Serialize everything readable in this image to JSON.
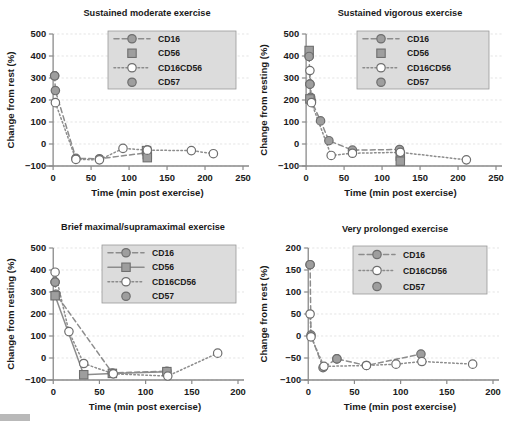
{
  "figure": {
    "panel_count": 4,
    "colors": {
      "marker_gray": "#9e9e9e",
      "marker_dark_gray": "#8c8c8c",
      "marker_white": "#ffffff",
      "line_gray": "#8c8c8c",
      "outline": "#6e6e6e",
      "grid": "#d9d9d9",
      "axis": "#8a8a8a",
      "legend_bg": "#dcdcdc",
      "text": "#1a1a1a"
    }
  },
  "charts": [
    {
      "id": "sustained-moderate",
      "type": "line",
      "title": "Sustained moderate exercise",
      "xlabel": "Time (min post exercise)",
      "ylabel": "Change from rest (%)",
      "xlim": [
        -12,
        250
      ],
      "ylim": [
        -100,
        500
      ],
      "xticks": [
        0,
        50,
        100,
        150,
        200,
        250
      ],
      "yticks": [
        -100,
        0,
        100,
        200,
        300,
        400,
        500
      ],
      "grid": true,
      "legend_position": "upper-right",
      "series": [
        {
          "name": "CD16",
          "marker": "circle",
          "fill": "#9e9e9e",
          "line": "dashed",
          "points": [
            {
              "x": 2,
              "y": 310
            },
            {
              "x": 3,
              "y": 243
            },
            {
              "x": 30,
              "y": -65
            },
            {
              "x": 61,
              "y": -67
            },
            {
              "x": 123,
              "y": -40
            },
            {
              "x": 124,
              "y": -27
            }
          ]
        },
        {
          "name": "CD56",
          "marker": "square",
          "fill": "#9e9e9e",
          "line": "none",
          "points": [
            {
              "x": 123,
              "y": -30
            },
            {
              "x": 124,
              "y": -48
            },
            {
              "x": 124,
              "y": -62
            }
          ]
        },
        {
          "name": "CD16CD56",
          "marker": "circle",
          "fill": "#ffffff",
          "line": "dotted",
          "points": [
            {
              "x": 3,
              "y": 188
            },
            {
              "x": 30,
              "y": -70
            },
            {
              "x": 61,
              "y": -72
            },
            {
              "x": 92,
              "y": -20
            },
            {
              "x": 124,
              "y": -28
            },
            {
              "x": 182,
              "y": -30
            },
            {
              "x": 211,
              "y": -44
            }
          ]
        },
        {
          "name": "CD57",
          "marker": "circle",
          "fill": "#9e9e9e",
          "line": "none",
          "points": [
            {
              "x": 2,
              "y": 310
            }
          ]
        }
      ]
    },
    {
      "id": "sustained-vigorous",
      "type": "line",
      "title": "Sustained vigorous exercise",
      "xlabel": "Time (min post exercise)",
      "ylabel": "Change from resting (%)",
      "xlim": [
        -12,
        250
      ],
      "ylim": [
        -100,
        500
      ],
      "xticks": [
        0,
        50,
        100,
        150,
        200,
        250
      ],
      "yticks": [
        -100,
        0,
        100,
        200,
        300,
        400,
        500
      ],
      "grid": true,
      "legend_position": "upper-right",
      "series": [
        {
          "name": "CD16",
          "marker": "circle",
          "fill": "#9e9e9e",
          "line": "dashed",
          "points": [
            {
              "x": 4,
              "y": 398
            },
            {
              "x": 5,
              "y": 272
            },
            {
              "x": 6,
              "y": 212
            },
            {
              "x": 7,
              "y": 196
            },
            {
              "x": 19,
              "y": 105
            },
            {
              "x": 30,
              "y": 15
            },
            {
              "x": 61,
              "y": -28
            },
            {
              "x": 123,
              "y": -25
            },
            {
              "x": 124,
              "y": -40
            }
          ]
        },
        {
          "name": "CD56",
          "marker": "square",
          "fill": "#9e9e9e",
          "line": "none",
          "points": [
            {
              "x": 4,
              "y": 425
            },
            {
              "x": 5,
              "y": 205
            },
            {
              "x": 124,
              "y": -55
            },
            {
              "x": 124,
              "y": -78
            }
          ]
        },
        {
          "name": "CD16CD56",
          "marker": "circle",
          "fill": "#ffffff",
          "line": "dotted",
          "points": [
            {
              "x": 5,
              "y": 334
            },
            {
              "x": 7,
              "y": 188
            },
            {
              "x": 33,
              "y": -52
            },
            {
              "x": 61,
              "y": -42
            },
            {
              "x": 124,
              "y": -38
            },
            {
              "x": 211,
              "y": -72
            }
          ]
        },
        {
          "name": "CD57",
          "marker": "circle",
          "fill": "#9e9e9e",
          "line": "none",
          "points": [
            {
              "x": 4,
              "y": 398
            },
            {
              "x": 5,
              "y": 272
            }
          ]
        }
      ]
    },
    {
      "id": "brief-maximal",
      "type": "line",
      "title": "Brief maximal/supramaximal exercise",
      "xlabel": "Time (min post exercise)",
      "ylabel": "Change from resting (%)",
      "xlim": [
        -10,
        200
      ],
      "ylim": [
        -100,
        500
      ],
      "xticks": [
        0,
        50,
        100,
        150,
        200
      ],
      "yticks": [
        -100,
        0,
        100,
        200,
        300,
        400,
        500
      ],
      "grid": true,
      "legend_position": "upper-right",
      "series": [
        {
          "name": "CD16",
          "marker": "circle",
          "fill": "#9e9e9e",
          "line": "dashed",
          "points": [
            {
              "x": 2,
              "y": 345
            },
            {
              "x": 3,
              "y": 290
            },
            {
              "x": 64,
              "y": -68
            },
            {
              "x": 123,
              "y": -60
            }
          ]
        },
        {
          "name": "CD56",
          "marker": "square",
          "fill": "#9e9e9e",
          "line": "solid",
          "points": [
            {
              "x": 2,
              "y": 283
            },
            {
              "x": 33,
              "y": -76
            },
            {
              "x": 64,
              "y": -70
            },
            {
              "x": 123,
              "y": -62
            }
          ]
        },
        {
          "name": "CD16CD56",
          "marker": "circle",
          "fill": "#ffffff",
          "line": "dotted",
          "points": [
            {
              "x": 2,
              "y": 390
            },
            {
              "x": 17,
              "y": 120
            },
            {
              "x": 33,
              "y": -25
            },
            {
              "x": 65,
              "y": -72
            },
            {
              "x": 124,
              "y": -82
            },
            {
              "x": 178,
              "y": 22
            }
          ]
        },
        {
          "name": "CD57",
          "marker": "circle",
          "fill": "#9e9e9e",
          "line": "none",
          "points": [
            {
              "x": 2,
              "y": 345
            }
          ]
        }
      ]
    },
    {
      "id": "very-prolonged",
      "type": "line",
      "title": "Very prolonged exercise",
      "xlabel": "Time (min post exercise)",
      "ylabel": "Change from rest (%)",
      "xlim": [
        -10,
        200
      ],
      "ylim": [
        -100,
        200
      ],
      "xticks": [
        0,
        50,
        100,
        150,
        200
      ],
      "yticks": [
        -100,
        -50,
        0,
        50,
        100,
        150,
        200
      ],
      "grid": true,
      "legend_position": "upper-right",
      "series": [
        {
          "name": "CD16",
          "marker": "circle",
          "fill": "#9e9e9e",
          "line": "dashed",
          "points": [
            {
              "x": 2,
              "y": 162
            },
            {
              "x": 3,
              "y": 2
            },
            {
              "x": 16,
              "y": -72
            },
            {
              "x": 31,
              "y": -52
            },
            {
              "x": 63,
              "y": -67
            },
            {
              "x": 122,
              "y": -41
            }
          ]
        },
        {
          "name": "CD16CD56",
          "marker": "circle",
          "fill": "#ffffff",
          "line": "dotted",
          "points": [
            {
              "x": 2,
              "y": 50
            },
            {
              "x": 3,
              "y": -2
            },
            {
              "x": 17,
              "y": -69
            },
            {
              "x": 63,
              "y": -67
            },
            {
              "x": 95,
              "y": -64
            },
            {
              "x": 123,
              "y": -58
            },
            {
              "x": 178,
              "y": -64
            }
          ]
        },
        {
          "name": "CD57",
          "marker": "circle",
          "fill": "#9e9e9e",
          "line": "none",
          "points": [
            {
              "x": 2,
              "y": 162
            },
            {
              "x": 31,
              "y": -52
            }
          ]
        }
      ]
    }
  ],
  "chart_data": {
    "type": "line",
    "xlabel": "Time (min post exercise)",
    "panels": [
      {
        "title": "Sustained moderate exercise",
        "ylabel": "Change from rest (%)",
        "xlim": [
          0,
          250
        ],
        "ylim": [
          -100,
          500
        ],
        "series": [
          {
            "name": "CD16",
            "x": [
              2,
              3,
              30,
              61,
              123,
              124
            ],
            "y": [
              310,
              243,
              -65,
              -67,
              -40,
              -27
            ]
          },
          {
            "name": "CD56",
            "x": [
              123,
              124,
              124
            ],
            "y": [
              -30,
              -48,
              -62
            ]
          },
          {
            "name": "CD16CD56",
            "x": [
              3,
              30,
              61,
              92,
              124,
              182,
              211
            ],
            "y": [
              188,
              -70,
              -72,
              -20,
              -28,
              -30,
              -44
            ]
          },
          {
            "name": "CD57",
            "x": [
              2
            ],
            "y": [
              310
            ]
          }
        ]
      },
      {
        "title": "Sustained vigorous exercise",
        "ylabel": "Change from resting (%)",
        "xlim": [
          0,
          250
        ],
        "ylim": [
          -100,
          500
        ],
        "series": [
          {
            "name": "CD16",
            "x": [
              4,
              5,
              6,
              7,
              19,
              30,
              61,
              123,
              124
            ],
            "y": [
              398,
              272,
              212,
              196,
              105,
              15,
              -28,
              -25,
              -40
            ]
          },
          {
            "name": "CD56",
            "x": [
              4,
              5,
              124,
              124
            ],
            "y": [
              425,
              205,
              -55,
              -78
            ]
          },
          {
            "name": "CD16CD56",
            "x": [
              5,
              7,
              33,
              61,
              124,
              211
            ],
            "y": [
              334,
              188,
              -52,
              -42,
              -38,
              -72
            ]
          },
          {
            "name": "CD57",
            "x": [
              4,
              5
            ],
            "y": [
              398,
              272
            ]
          }
        ]
      },
      {
        "title": "Brief maximal/supramaximal exercise",
        "ylabel": "Change from resting (%)",
        "xlim": [
          0,
          200
        ],
        "ylim": [
          -100,
          500
        ],
        "series": [
          {
            "name": "CD16",
            "x": [
              2,
              3,
              64,
              123
            ],
            "y": [
              345,
              290,
              -68,
              -60
            ]
          },
          {
            "name": "CD56",
            "x": [
              2,
              33,
              64,
              123
            ],
            "y": [
              283,
              -76,
              -70,
              -62
            ]
          },
          {
            "name": "CD16CD56",
            "x": [
              2,
              17,
              33,
              65,
              124,
              178
            ],
            "y": [
              390,
              120,
              -25,
              -72,
              -82,
              22
            ]
          },
          {
            "name": "CD57",
            "x": [
              2
            ],
            "y": [
              345
            ]
          }
        ]
      },
      {
        "title": "Very prolonged exercise",
        "ylabel": "Change from rest (%)",
        "xlim": [
          0,
          200
        ],
        "ylim": [
          -100,
          200
        ],
        "series": [
          {
            "name": "CD16",
            "x": [
              2,
              3,
              16,
              31,
              63,
              122
            ],
            "y": [
              162,
              2,
              -72,
              -52,
              -67,
              -41
            ]
          },
          {
            "name": "CD16CD56",
            "x": [
              2,
              3,
              17,
              63,
              95,
              123,
              178
            ],
            "y": [
              50,
              -2,
              -69,
              -67,
              -64,
              -58,
              -64
            ]
          },
          {
            "name": "CD57",
            "x": [
              2,
              31
            ],
            "y": [
              162,
              -52
            ]
          }
        ]
      }
    ]
  }
}
